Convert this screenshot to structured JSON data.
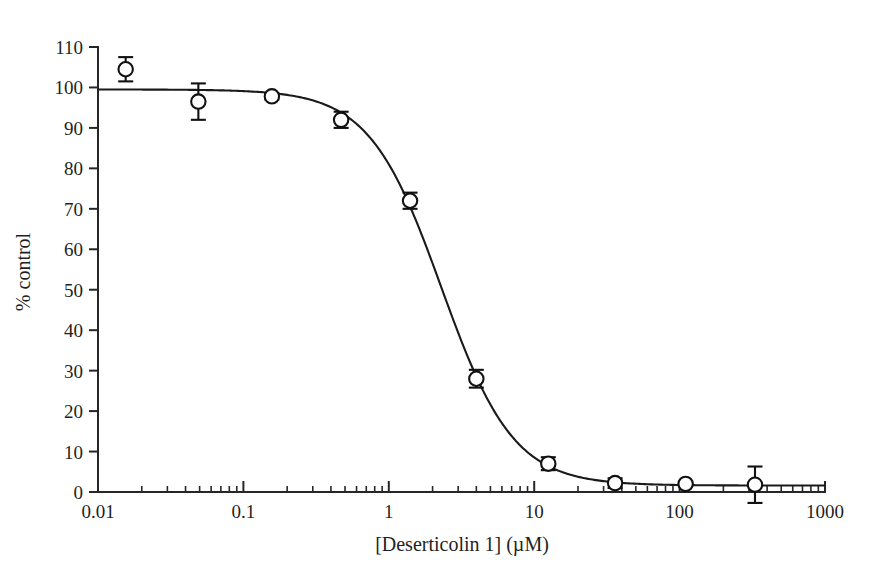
{
  "figure": {
    "width": 875,
    "height": 581,
    "background": "#ffffff",
    "ink_color": "#1a1a1a"
  },
  "chart_data": {
    "type": "scatter",
    "title": "",
    "subtitle": "",
    "xlabel": "[Deserticolin 1] (µM)",
    "ylabel": "% control",
    "xscale": "log",
    "yscale": "linear",
    "xlim": [
      0.01,
      1000
    ],
    "ylim": [
      0,
      110
    ],
    "grid": false,
    "legend": null,
    "x_tick_labels": [
      "0.01",
      "0.1",
      "1",
      "10",
      "100",
      "1000"
    ],
    "x_tick_values": [
      0.01,
      0.1,
      1,
      10,
      100,
      1000
    ],
    "y_tick_labels": [
      "0",
      "10",
      "20",
      "30",
      "40",
      "50",
      "60",
      "70",
      "80",
      "90",
      "100",
      "110"
    ],
    "y_tick_values": [
      0,
      10,
      20,
      30,
      40,
      50,
      60,
      70,
      80,
      90,
      100,
      110
    ],
    "marker_style": "open-circle",
    "series": [
      {
        "name": "Deserticolin 1 dose-response",
        "x": [
          0.0155,
          0.049,
          0.157,
          0.47,
          1.4,
          4.0,
          12.5,
          36,
          110,
          330
        ],
        "y": [
          104.5,
          96.5,
          97.8,
          92.0,
          72.0,
          28.0,
          7.0,
          2.2,
          2.0,
          1.8
        ],
        "yerr": [
          3.0,
          4.5,
          0.8,
          2.0,
          2.0,
          2.2,
          1.6,
          1.2,
          0.0,
          4.5
        ]
      }
    ],
    "fit": {
      "model": "four-parameter-logistic",
      "top": 99.5,
      "bottom": 1.6,
      "ic50": 2.3,
      "hill_slope": 1.75
    }
  }
}
